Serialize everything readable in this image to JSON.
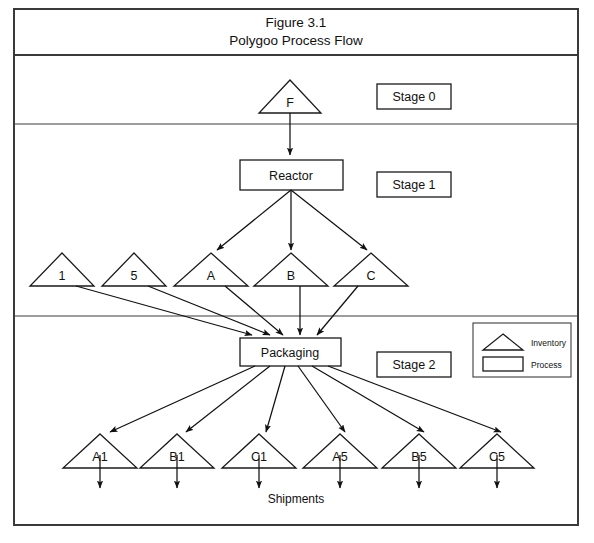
{
  "figure": {
    "title_line1": "Figure 3.1",
    "title_line2": "Polygoo Process Flow"
  },
  "stages": [
    {
      "label": "Stage 0"
    },
    {
      "label": "Stage 1"
    },
    {
      "label": "Stage 2"
    }
  ],
  "nodes": {
    "feed": {
      "label": "F",
      "type": "inventory"
    },
    "reactor": {
      "label": "Reactor",
      "type": "process"
    },
    "packaging": {
      "label": "Packaging",
      "type": "process"
    }
  },
  "intermediate_inventories": [
    {
      "label": "1"
    },
    {
      "label": "5"
    },
    {
      "label": "A"
    },
    {
      "label": "B"
    },
    {
      "label": "C"
    }
  ],
  "product_inventories": [
    {
      "label": "A1"
    },
    {
      "label": "B1"
    },
    {
      "label": "C1"
    },
    {
      "label": "A5"
    },
    {
      "label": "B5"
    },
    {
      "label": "C5"
    }
  ],
  "shipments": {
    "label": "Shipments"
  },
  "legend": {
    "items": [
      {
        "shape": "triangle",
        "label": "Inventory"
      },
      {
        "shape": "rectangle",
        "label": "Process"
      }
    ]
  },
  "colors": {
    "ink": "#111111",
    "frame": "#3a3a3a",
    "background": "#ffffff"
  }
}
